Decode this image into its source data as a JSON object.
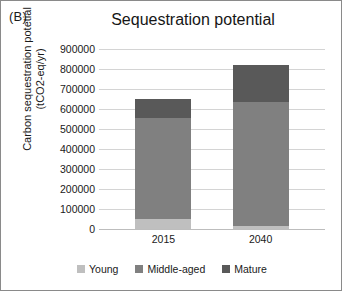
{
  "panel": {
    "label": "(B)"
  },
  "chart_data": {
    "type": "bar",
    "subtype": "stacked",
    "title": "Sequestration potential",
    "xlabel": "",
    "ylabel": "Carbon sequestration potetial (tCO2-eq/yr)",
    "ylabel_line1": "Carbon sequestration potetial",
    "ylabel_line2": "(tCO2-eq/yr)",
    "categories": [
      "2015",
      "2040"
    ],
    "ylim": [
      0,
      900000
    ],
    "ytick_step": 100000,
    "yticks": [
      900000,
      800000,
      700000,
      600000,
      500000,
      400000,
      300000,
      200000,
      100000,
      0
    ],
    "ytick_labels": [
      "900000",
      "800000",
      "700000",
      "600000",
      "500000",
      "400000",
      "300000",
      "200000",
      "100000",
      "0"
    ],
    "grid": true,
    "legend_position": "bottom",
    "series": [
      {
        "name": "Young",
        "color": "#bfbfbf",
        "values": [
          50000,
          15000
        ]
      },
      {
        "name": "Middle-aged",
        "color": "#808080",
        "values": [
          505000,
          620000
        ]
      },
      {
        "name": "Mature",
        "color": "#595959",
        "values": [
          95000,
          185000
        ]
      }
    ],
    "totals": [
      650000,
      820000
    ]
  }
}
